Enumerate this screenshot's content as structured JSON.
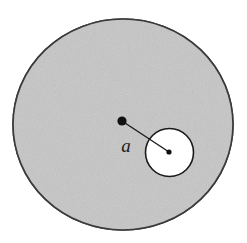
{
  "figure": {
    "name": "uniform-disk-with-circular-cavity",
    "canvas": {
      "width": 247,
      "height": 243,
      "background": "#ffffff"
    },
    "large_disk": {
      "role": "shaded-body",
      "center_x": 123,
      "center_y": 124.5,
      "radius_x": 110,
      "radius_y": 105.5,
      "fill": "#c6c6c6",
      "stroke": "#3a3a3a",
      "stroke_width": 1.6
    },
    "cavity": {
      "role": "circular-hole",
      "center_x": 169.5,
      "center_y": 152.5,
      "radius": 24,
      "fill": "#ffffff",
      "stroke": "#1a1a1a",
      "stroke_width": 1.6
    },
    "center_dot": {
      "role": "disk-center-marker",
      "x": 122,
      "y": 121,
      "radius": 4.6,
      "fill": "#111111"
    },
    "cavity_dot": {
      "role": "cavity-center-marker",
      "x": 169,
      "y": 152,
      "radius": 2.6,
      "fill": "#111111"
    },
    "connector": {
      "role": "center-to-cavity-distance-line",
      "x1": 122,
      "y1": 121,
      "x2": 169,
      "y2": 152,
      "stroke": "#1a1a1a",
      "stroke_width": 1.4
    },
    "labels": {
      "distance": {
        "text": "a",
        "x": 126,
        "y": 152,
        "font_size": 19,
        "style": "italic",
        "color": "#1c1c1c"
      }
    }
  }
}
